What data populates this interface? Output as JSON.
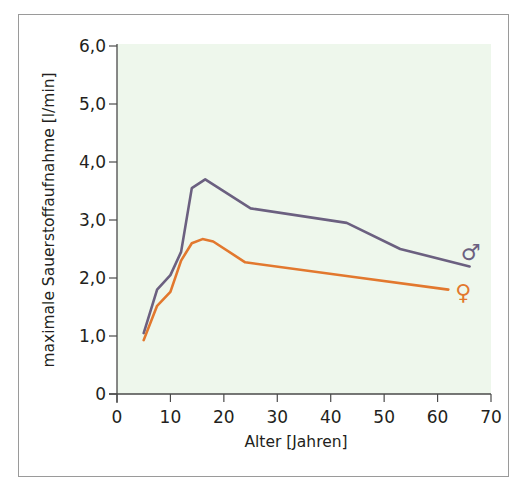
{
  "chart_data": {
    "type": "line",
    "title": "",
    "xlabel": "Alter [Jahren]",
    "ylabel": "maximale Sauerstoffaufnahme [l/min]",
    "xlim": [
      0,
      70
    ],
    "ylim": [
      0,
      6
    ],
    "x_ticks": [
      "0",
      "10",
      "20",
      "30",
      "40",
      "50",
      "60",
      "70"
    ],
    "y_ticks": [
      "0",
      "1,0",
      "2,0",
      "3,0",
      "4,0",
      "5,0",
      "6,0"
    ],
    "grid": false,
    "legend_position": "inline-right",
    "plot_background": "#eef7ec",
    "series": [
      {
        "name": "männlich",
        "symbol": "♂",
        "color": "#6b6080",
        "x": [
          5,
          7.5,
          10,
          12,
          14,
          16.5,
          25,
          43,
          53,
          66
        ],
        "values": [
          1.05,
          1.8,
          2.05,
          2.45,
          3.55,
          3.7,
          3.2,
          2.95,
          2.5,
          2.2
        ]
      },
      {
        "name": "weiblich",
        "symbol": "♀",
        "color": "#e2782e",
        "x": [
          5,
          7.5,
          10,
          12,
          14,
          16,
          18,
          24,
          44,
          62
        ],
        "values": [
          0.93,
          1.52,
          1.76,
          2.3,
          2.6,
          2.67,
          2.63,
          2.27,
          2.02,
          1.8
        ]
      }
    ]
  }
}
